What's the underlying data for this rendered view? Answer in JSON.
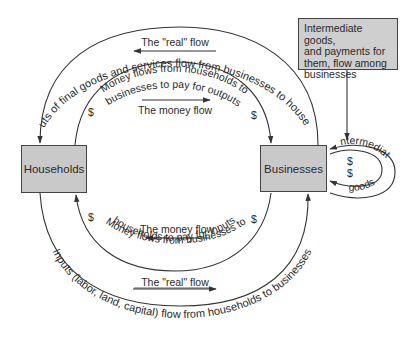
{
  "diagram": {
    "type": "circular-flow",
    "nodes": {
      "households": {
        "label": "Households"
      },
      "businesses": {
        "label": "Businesses"
      },
      "intermediate_note": {
        "lines": [
          "Intermediate goods,",
          "and payments for",
          "them, flow among",
          "businesses"
        ]
      }
    },
    "outer_top_arc": {
      "label": "Outputs of final goods and services flow from businesses to households",
      "arrow_label": "The \"real\" flow",
      "direction": "businesses-to-households"
    },
    "inner_top_arc": {
      "label_line1": "Money flows from households to",
      "label_line2": "businesses to pay for outputs",
      "arrow_label": "The money flow",
      "dollar_left": "$",
      "dollar_right": "$",
      "direction": "households-to-businesses"
    },
    "inner_bottom_arc": {
      "label_line1": "Money flows from businesses to",
      "label_line2": "households to pay for inputs",
      "arrow_label": "The money flow",
      "dollar_left": "$",
      "dollar_right": "$",
      "direction": "businesses-to-households"
    },
    "outer_bottom_arc": {
      "label": "Inputs (labor, land, capital) flow from households to businesses",
      "arrow_label": "The \"real\" flow",
      "direction": "households-to-businesses"
    },
    "intermediate_loop": {
      "top_label": "intermediate",
      "dollar1": "$",
      "dollar2": "$",
      "bottom_label": "goods"
    },
    "colors": {
      "box_fill": "#c9c9c9",
      "stroke": "#333333",
      "text": "#2a2a2a",
      "background": "#ffffff"
    }
  }
}
